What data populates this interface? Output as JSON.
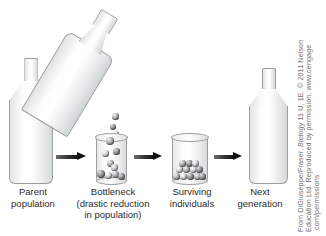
{
  "figure": {
    "background_color": "#ffffff",
    "marble_color": "#8b9090",
    "arrow_color": "#101212",
    "caption_color": "#2b2b2b"
  },
  "stages": [
    {
      "id": "parent-population",
      "caption": "Parent\npopulation",
      "vessel": "bottle",
      "marble_count": 46
    },
    {
      "id": "bottleneck",
      "caption": "Bottleneck\n(drastic reduction\nin population)",
      "vessel": "cylinder",
      "marble_count": 9
    },
    {
      "id": "surviving-individuals",
      "caption": "Surviving\nindividuals",
      "vessel": "cylinder",
      "marble_count": 12
    },
    {
      "id": "next-generation",
      "caption": "Next\ngeneration",
      "vessel": "bottle",
      "marble_count": 40
    }
  ],
  "pouring_bottle": {
    "id": "pouring-bottle",
    "marble_count": 34
  },
  "arrows": [
    {
      "id": "arrow-1",
      "from": "parent-population",
      "to": "bottleneck"
    },
    {
      "id": "arrow-2",
      "from": "bottleneck",
      "to": "surviving-individuals"
    },
    {
      "id": "arrow-3",
      "from": "surviving-individuals",
      "to": "next-generation"
    }
  ],
  "attribution": {
    "line1_prefix": "From DiGiuseppe/Fraser. ",
    "line1_italic": "Biology",
    "line1_suffix": " 11 U, 1E. © 2011 Nelson",
    "line2": "Education Ltd. Reproduced by permission. www.cengage",
    "line3": ".com/permissions"
  }
}
